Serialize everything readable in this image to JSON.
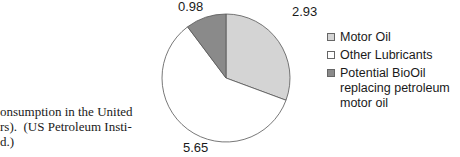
{
  "chart_data": {
    "type": "pie",
    "title": "",
    "categories": [
      "Motor Oil",
      "Other Lubricants",
      "Potential BioOil replacing petroleum motor oil"
    ],
    "values": [
      2.93,
      5.65,
      0.98
    ],
    "colors": [
      "#d4d4d4",
      "#ffffff",
      "#8a8a8a"
    ],
    "start_angle_deg": 0,
    "direction": "clockwise",
    "data_labels": [
      "2.93",
      "5.65",
      "0.98"
    ],
    "legend_position": "right"
  },
  "labels": {
    "motor_oil": "2.93",
    "other_lubricants": "5.65",
    "bioil": "0.98"
  },
  "legend": {
    "items": [
      {
        "label": "Motor Oil",
        "color": "#d4d4d4"
      },
      {
        "label": "Other Lubricants",
        "color": "#ffffff"
      },
      {
        "label": "Potential BioOil replacing petroleum motor oil",
        "color": "#8a8a8a"
      }
    ]
  },
  "caption": {
    "line1": "onsumption in the United",
    "line2": "rs).  (US Petroleum Insti-",
    "line3": "d.)"
  }
}
